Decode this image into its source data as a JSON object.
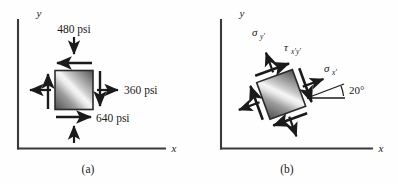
{
  "figure": {
    "panels": [
      {
        "id": "panel-a",
        "caption": "(a)",
        "axis_x_label": "x",
        "axis_y_label": "y",
        "element_type": "plane-stress-element",
        "labels": [
          {
            "name": "sigma-y-value",
            "text": "480 psi"
          },
          {
            "name": "sigma-x-value",
            "text": "360 psi"
          },
          {
            "name": "tau-xy-value",
            "text": "640 psi"
          }
        ]
      },
      {
        "id": "panel-b",
        "caption": "(b)",
        "axis_x_label": "x",
        "axis_y_label": "y",
        "element_type": "rotated-plane-stress-element",
        "rotation_deg": 20,
        "labels": [
          {
            "name": "sigma-y-prime",
            "base": "σ",
            "sub": "y′"
          },
          {
            "name": "tau-x-prime-y-prime",
            "base": "τ",
            "sub": "x′y′"
          },
          {
            "name": "sigma-x-prime",
            "base": "σ",
            "sub": "x′"
          },
          {
            "name": "angle-label",
            "text": "20°"
          }
        ]
      }
    ],
    "colors": {
      "ink": "#1a1a1a",
      "axis": "#3a3a3a",
      "element_dark": "#4a4a4a",
      "element_light": "#f2f2f2",
      "element_border": "#2b2b2b",
      "background": "#fefefe"
    }
  }
}
